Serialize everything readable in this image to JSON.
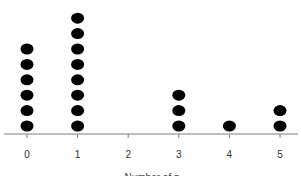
{
  "chart_data": {
    "type": "dot",
    "title": "",
    "xlabel": "Number of p",
    "ylabel": "",
    "categories": [
      "0",
      "1",
      "2",
      "3",
      "4",
      "5"
    ],
    "values": [
      6,
      8,
      0,
      3,
      1,
      2
    ],
    "grid": false,
    "legend": null,
    "dot_color": "#000000",
    "axis_color": "#7f7f7f"
  }
}
